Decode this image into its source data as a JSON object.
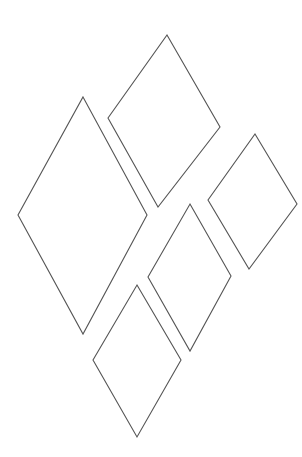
{
  "canvas": {
    "width": 302,
    "height": 457,
    "background": "#ffffff",
    "stroke": "#555555",
    "stroke_width": 1.1
  },
  "diamonds": [
    {
      "id": "top-center",
      "points": [
        [
          167,
          35
        ],
        [
          220,
          127
        ],
        [
          158,
          207
        ],
        [
          108,
          118
        ]
      ]
    },
    {
      "id": "left-large",
      "points": [
        [
          83,
          97
        ],
        [
          147,
          215
        ],
        [
          83,
          334
        ],
        [
          18,
          215
        ]
      ]
    },
    {
      "id": "right",
      "points": [
        [
          255,
          134
        ],
        [
          297,
          204
        ],
        [
          249,
          269
        ],
        [
          208,
          200
        ]
      ]
    },
    {
      "id": "middle",
      "points": [
        [
          190,
          204
        ],
        [
          231,
          276
        ],
        [
          190,
          351
        ],
        [
          148,
          277
        ]
      ]
    },
    {
      "id": "bottom",
      "points": [
        [
          137,
          285
        ],
        [
          181,
          360
        ],
        [
          137,
          437
        ],
        [
          93,
          360
        ]
      ]
    }
  ]
}
